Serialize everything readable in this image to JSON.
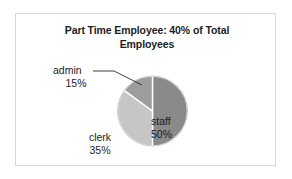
{
  "chart_data": {
    "type": "pie",
    "title": "Part Time Employee: 40% of Total Employees",
    "title_line1": "Part Time Employee: 40% of Total",
    "title_line2": "Employees",
    "categories": [
      "staff",
      "clerk",
      "admin"
    ],
    "values": [
      50,
      35,
      15
    ],
    "value_labels": [
      "50%",
      "35%",
      "15%"
    ],
    "unit": "%",
    "start_angle_deg": 0,
    "direction": "clockwise",
    "legend": "none",
    "grid": false,
    "labels_inside": [
      "staff"
    ],
    "labels_outside": [
      "clerk",
      "admin"
    ],
    "leader_lines": [
      "admin"
    ],
    "slices": [
      {
        "name": "staff",
        "value": 50,
        "value_label": "50%",
        "color": "#8a8a8a",
        "start_deg": 0,
        "end_deg": 180,
        "label_position": "inside"
      },
      {
        "name": "clerk",
        "value": 35,
        "value_label": "35%",
        "color": "#c6c6c6",
        "start_deg": 180,
        "end_deg": 306,
        "label_position": "outside"
      },
      {
        "name": "admin",
        "value": 15,
        "value_label": "15%",
        "color": "#9d9d9d",
        "start_deg": 306,
        "end_deg": 360,
        "label_position": "outside-leader"
      }
    ],
    "xlabel": "",
    "ylabel": ""
  },
  "figure": {
    "border_color": "#d8d8d8",
    "background": "#ffffff",
    "slice_divider_color": "#ffffff"
  }
}
